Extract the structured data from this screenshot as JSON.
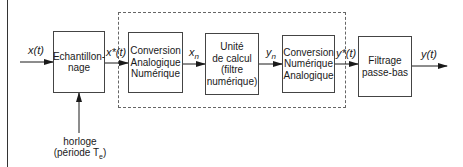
{
  "diagram": {
    "type": "block-diagram",
    "blocks": [
      {
        "id": "echantillonnage",
        "lines": [
          "Echantillon-",
          "nage"
        ]
      },
      {
        "id": "can",
        "lines": [
          "Conversion",
          "Analogique",
          "Numérique"
        ]
      },
      {
        "id": "unite",
        "lines": [
          "Unité",
          "de calcul",
          "(filtre",
          "numérique)"
        ]
      },
      {
        "id": "cna",
        "lines": [
          "Conversion",
          "Numérique",
          "Analogique"
        ]
      },
      {
        "id": "filtrage",
        "lines": [
          "Filtrage",
          "passe-bas"
        ]
      }
    ],
    "signals": {
      "input": {
        "base": "x(t)"
      },
      "sampled": {
        "base": "x*(t)"
      },
      "xn": {
        "base": "x",
        "sub": "n"
      },
      "yn": {
        "base": "y",
        "sub": "n"
      },
      "reconstructed": {
        "base": "y*(t)"
      },
      "output": {
        "base": "y(t)"
      }
    },
    "clock": {
      "line1": "horloge",
      "line2_prefix": "(période T",
      "line2_sub": "e",
      "line2_suffix": ")"
    },
    "colors": {
      "line": "#1a1a1a",
      "dashed": "#666666",
      "background": "#ffffff"
    }
  }
}
